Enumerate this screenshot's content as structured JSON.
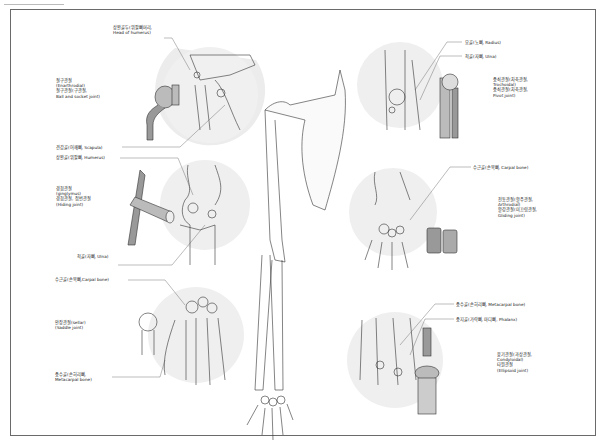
{
  "diagram": {
    "labels": {
      "head_of_humerus": [
        "상완골두(위팔뼈머리,",
        "Head of humerus)"
      ],
      "ball_socket_joint": [
        "절구관절",
        "(Enarthrodial)",
        "절구관절(구관절,",
        "Ball and socket joint)"
      ],
      "scapula": [
        "견갑골(어깨뼈, Scapula)"
      ],
      "humerus": [
        "상완골(위팔뼈, Humerus)"
      ],
      "hinge_joint": [
        "경첩관절",
        "(ginglymus)",
        "경첩관절, 접번관절",
        "(Hiding joint)"
      ],
      "ulna_left": [
        "척골(자뼈, Ulna)"
      ],
      "carpal_left": [
        "수근골(손목뼈,Carpal bone)"
      ],
      "saddle_joint": [
        "안장관절(sellar)",
        "(Saddle joint)"
      ],
      "metacarpal_left": [
        "중수골(손허리뼈,",
        "Metacarpal bone)"
      ],
      "radius": [
        "요골(노뼈, Radius)"
      ],
      "ulna_right": [
        "척골(자뼈, Ulna)"
      ],
      "pivot_joint": [
        "중쇠관절(차축관절,",
        "Trochoidal)",
        "중쇠관절(차축관절,",
        "Pivot joint)"
      ],
      "carpal_right": [
        "수근골(손목뼈, Carpal bone)"
      ],
      "gliding_joint": [
        "전동관절(활주관절,",
        "Arthrodial)",
        "활강관절(미끄럼관절,",
        "Gliding joint)"
      ],
      "metacarpal_right": [
        "중수골(손허리뼈, Metacarpal bone)"
      ],
      "phalanx": [
        "중지골(가락뼈, 마디뼈, Phalanx)"
      ],
      "ellipsoid_joint": [
        "융기관절(과상관절,",
        "Condyloidal)",
        "타원관절",
        "(Ellipsoid joint)"
      ]
    }
  }
}
